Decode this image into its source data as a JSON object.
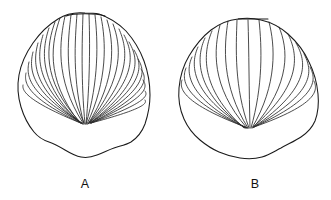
{
  "plate": {
    "name": "fossil-shell-comparison-plate",
    "background_color": "#ffffff",
    "line_color": "#1a1a1a",
    "rib_color": "#2b2b2b",
    "width": 331,
    "height": 200
  },
  "figures": [
    {
      "id": "figure-a",
      "label": "A",
      "label_x": 85,
      "label_y": 188,
      "description": "shell-valve-many-fine-ribs",
      "rib_count": 27,
      "beak_x": 85,
      "beak_y": 124,
      "outline_path": "M 85 13 C 75 12 66 14 58 19 C 48 25 40 33 33 43 C 26 53 21 64 19 75 C 17 86 18 97 21 107 C 24 117 29 126 34 132 C 38 137 43 140 49 142 C 55 144 60 147 65 150 C 70 153 75 156 81 157 C 86 158 92 157 97 155 C 103 153 108 150 114 148 C 120 146 126 145 131 142 C 137 138 142 132 145 124 C 148 115 150 105 150 95 C 150 84 148 72 144 61 C 140 50 134 40 126 31 C 118 23 108 17 99 14 C 94 13 89 13 85 13 Z",
      "hinge_path": "M 66 16 C 74 13 96 13 105 16",
      "ribs": [
        {
          "d": "M 60 18 C 52 41 44 77 79 122"
        },
        {
          "d": "M 55 22 C 47 44 40 79 80 122"
        },
        {
          "d": "M 49 28 C 42 49 37 82 80 123"
        },
        {
          "d": "M 43 35 C 37 55 34 85 81 123"
        },
        {
          "d": "M 38 43 C 33 61 31 88 81 123"
        },
        {
          "d": "M 33 52 C 29 68 29 91 82 123"
        },
        {
          "d": "M 29 62 C 26 75 27 94 82 123"
        },
        {
          "d": "M 26 73 C 24 82 25 97 83 124"
        },
        {
          "d": "M 65 16 C 60 40 54 78 83 123"
        },
        {
          "d": "M 71 15 C 68 40 63 79 84 123"
        },
        {
          "d": "M 77 14 C 75 40 72 80 84 124"
        },
        {
          "d": "M 83 14 C 82 42 81 82 85 124"
        },
        {
          "d": "M 89 14 C 90 42 90 82 86 124"
        },
        {
          "d": "M 95 15 C 98 41 99 81 86 124"
        },
        {
          "d": "M 101 17 C 106 41 108 80 87 124"
        },
        {
          "d": "M 107 20 C 114 42 117 79 88 124"
        },
        {
          "d": "M 113 24 C 121 45 125 78 88 124"
        },
        {
          "d": "M 119 29 C 128 49 132 79 89 123"
        },
        {
          "d": "M 124 35 C 134 54 138 80 89 123"
        },
        {
          "d": "M 129 42 C 139 59 143 82 90 123"
        },
        {
          "d": "M 134 50 C 143 65 146 85 90 123"
        },
        {
          "d": "M 138 59 C 146 72 148 89 90 123"
        },
        {
          "d": "M 141 69 C 148 79 149 93 91 123"
        },
        {
          "d": "M 143 80 C 148 87 149 97 91 123"
        },
        {
          "d": "M 145 91 C 148 95 149 102 91 123"
        },
        {
          "d": "M 23 85 C 22 90 24 100 83 124"
        },
        {
          "d": "M 145 100 C 147 103 147 108 91 123"
        }
      ]
    },
    {
      "id": "figure-b",
      "label": "B",
      "label_x": 255,
      "label_y": 188,
      "description": "shell-valve-fewer-coarse-ribs-with-hinge-line",
      "rib_count": 16,
      "beak_x": 249,
      "beak_y": 129,
      "outline_path": "M 238 19 C 228 20 219 24 211 30 C 202 37 195 46 189 56 C 183 66 180 77 179 88 C 178 99 180 110 184 119 C 188 128 194 135 200 140 C 206 145 212 149 219 152 C 226 155 233 157 240 158 C 247 159 255 159 262 157 C 269 155 275 151 281 148 C 288 144 295 141 301 137 C 307 133 312 128 315 121 C 318 113 319 104 318 94 C 317 83 314 72 309 62 C 304 51 297 42 288 34 C 280 27 270 22 261 20 C 253 18 245 18 238 19 Z",
      "hinge_path": "M 238 19 L 268 19",
      "ribs": [
        {
          "d": "M 212 31 C 203 52 199 88 244 128"
        },
        {
          "d": "M 205 38 C 196 57 194 91 245 128"
        },
        {
          "d": "M 198 47 C 190 64 190 94 246 128"
        },
        {
          "d": "M 192 57 C 185 72 186 97 246 128"
        },
        {
          "d": "M 186 68 C 181 80 183 100 247 128"
        },
        {
          "d": "M 182 80 C 179 88 181 103 248 128"
        },
        {
          "d": "M 220 25 C 214 48 210 86 247 128"
        },
        {
          "d": "M 228 21 C 224 46 221 85 248 128"
        },
        {
          "d": "M 237 20 C 236 48 234 87 249 128"
        },
        {
          "d": "M 248 20 C 249 50 249 90 250 128"
        },
        {
          "d": "M 259 20 C 262 48 263 86 251 128"
        },
        {
          "d": "M 269 22 C 275 45 278 84 252 128"
        },
        {
          "d": "M 279 27 C 288 48 292 83 253 128"
        },
        {
          "d": "M 288 34 C 298 54 303 84 253 127"
        },
        {
          "d": "M 296 43 C 307 62 311 87 254 127"
        },
        {
          "d": "M 304 54 C 313 71 316 92 254 127"
        },
        {
          "d": "M 310 67 C 317 80 318 98 254 127"
        },
        {
          "d": "M 314 81 C 318 90 319 104 254 127"
        }
      ]
    }
  ]
}
